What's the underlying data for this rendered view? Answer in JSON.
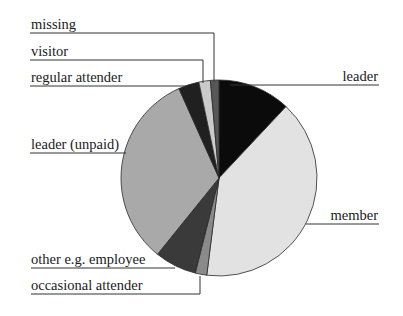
{
  "chart_data": {
    "type": "pie",
    "title": "",
    "start_angle_deg": 0,
    "direction": "clockwise",
    "slices": [
      {
        "label": "leader",
        "value": 12.0,
        "color": "#0b0b0b"
      },
      {
        "label": "member",
        "value": 40.0,
        "color": "#e2e2e2"
      },
      {
        "label": "occasional attender",
        "value": 1.9,
        "color": "#8a8a8a"
      },
      {
        "label": "other e.g. employee",
        "value": 6.9,
        "color": "#3a3a3a"
      },
      {
        "label": "leader (unpaid)",
        "value": 32.5,
        "color": "#a9a9a9"
      },
      {
        "label": "regular attender",
        "value": 3.4,
        "color": "#202020"
      },
      {
        "label": "visitor",
        "value": 1.9,
        "color": "#cacaca"
      },
      {
        "label": "missing",
        "value": 1.4,
        "color": "#575757"
      }
    ],
    "legend": "none (leader-line labels)",
    "unit": "percent (estimated from slice angles)"
  },
  "labels": {
    "missing": "missing",
    "visitor": "visitor",
    "regular_attender": "regular attender",
    "leader": "leader",
    "leader_unpaid": "leader (unpaid)",
    "member": "member",
    "other_employee": "other e.g. employee",
    "occasional_attender": "occasional attender"
  }
}
